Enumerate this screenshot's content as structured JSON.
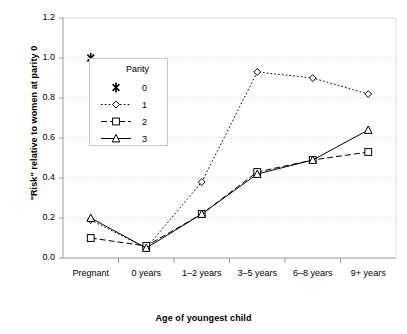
{
  "chart_data": {
    "type": "line",
    "title": "",
    "xlabel": "Age of youngest child",
    "ylabel": "\"Risk\" relative to women at parity 0",
    "categories": [
      "Pregnant",
      "0 years",
      "1–2 years",
      "3–5 years",
      "6–8 years",
      "9+ years"
    ],
    "ylim": [
      0.0,
      1.2
    ],
    "yticks": [
      "0.0",
      "0.2",
      "0.4",
      "0.6",
      "0.8",
      "1.0",
      "1.2"
    ],
    "ytick_values": [
      0.0,
      0.2,
      0.4,
      0.6,
      0.8,
      1.0,
      1.2
    ],
    "grid": true,
    "grid_style": "dotted-horizontal",
    "legend_position": "inside-upper-left",
    "legend_title": "Parity",
    "series": [
      {
        "name": "0",
        "values": [
          1.0,
          null,
          null,
          null,
          null,
          null
        ],
        "marker": "x",
        "line": "none",
        "color": "#000000"
      },
      {
        "name": "1",
        "values": [
          0.19,
          0.05,
          0.38,
          0.93,
          0.9,
          0.82
        ],
        "marker": "diamond",
        "line": "dotted",
        "color": "#000000"
      },
      {
        "name": "2",
        "values": [
          0.1,
          0.06,
          0.22,
          0.43,
          0.49,
          0.53
        ],
        "marker": "square",
        "line": "dashed",
        "color": "#000000"
      },
      {
        "name": "3",
        "values": [
          0.2,
          0.05,
          0.22,
          0.42,
          0.49,
          0.64
        ],
        "marker": "triangle",
        "line": "solid",
        "color": "#000000"
      }
    ]
  },
  "legend": {
    "title": "Parity",
    "entries": [
      {
        "label": "0"
      },
      {
        "label": "1"
      },
      {
        "label": "2"
      },
      {
        "label": "3"
      }
    ]
  },
  "axes": {
    "x_title": "Age of youngest child",
    "y_title": "\"Risk\" relative to women at parity 0",
    "x_tick_labels": [
      "Pregnant",
      "0 years",
      "1–2 years",
      "3–5 years",
      "6–8 years",
      "9+ years"
    ],
    "y_tick_labels": [
      "1.2",
      "1.0",
      "0.8",
      "0.6",
      "0.4",
      "0.2",
      "0.0"
    ]
  },
  "colors": {
    "ink": "#000000",
    "grid": "#d0d0d0",
    "frame": "#808080",
    "background": "#ffffff"
  }
}
